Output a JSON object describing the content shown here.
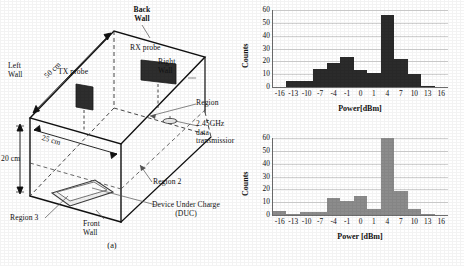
{
  "figure": {
    "panel_a": {
      "caption": "(a)",
      "labels": {
        "back_wall": "Back\nWall",
        "left_wall": "Left\nWall",
        "right_wall": "Right\nWall",
        "front_wall": "Front\nWall",
        "rx_probe": "RX probe",
        "tx_probe": "TX probe",
        "dim_depth": "50 cm",
        "dim_width": "25 cm",
        "dim_height": "20 cm",
        "region_1": "Region",
        "region_2": "Region 2",
        "region_3": "Region 3",
        "transmitter": "2.45GHz\ndata\ntransmissior",
        "duc": "Device Under Charge\n(DUC)"
      },
      "label_lines": {
        "back_wall_1": "Back",
        "back_wall_2": "Wall",
        "left_wall_1": "Left",
        "left_wall_2": "Wall",
        "right_wall_1": "Right",
        "right_wall_2": "Wall",
        "front_wall_1": "Front",
        "front_wall_2": "Wall",
        "transmitter_1": "2.45GHz",
        "transmitter_2": "data",
        "transmitter_3": "transmissior",
        "duc_1": "Device Under Charge",
        "duc_2": "(DUC)"
      }
    },
    "panel_b": {
      "caption": "(b)"
    }
  },
  "chart_data": [
    {
      "type": "bar",
      "title": "",
      "subtitle": "",
      "xlabel": "Power[dBm]",
      "ylabel": "Counts",
      "categories": [
        "-16",
        "-13",
        "-10",
        "-7",
        "-4",
        "-1",
        "0",
        "1",
        "4",
        "7",
        "10",
        "13",
        "16"
      ],
      "x": [
        -16,
        -13,
        -10,
        -7,
        -4,
        -1,
        0,
        1,
        4,
        7,
        10,
        13,
        16
      ],
      "values": [
        0,
        5,
        5,
        14,
        19,
        23,
        13,
        11,
        56,
        22,
        10,
        1,
        0
      ],
      "xlim": [
        -17.5,
        17.5
      ],
      "ylim": [
        0,
        60
      ],
      "yticks": [
        0,
        10,
        20,
        30,
        40,
        50,
        60
      ],
      "grid": true,
      "legend": "none",
      "bar_color": "#2b2b2b",
      "panel": "top"
    },
    {
      "type": "bar",
      "title": "",
      "subtitle": "",
      "xlabel": "Power [dBm]",
      "ylabel": "Counts",
      "categories": [
        "-16",
        "-13",
        "-10",
        "-7",
        "-4",
        "-1",
        "0",
        "1",
        "4",
        "7",
        "10",
        "13",
        "16"
      ],
      "x": [
        -16,
        -13,
        -10,
        -7,
        -4,
        -1,
        0,
        1,
        4,
        7,
        10,
        13,
        16
      ],
      "values": [
        3,
        1,
        2,
        2,
        13,
        11,
        15,
        5,
        60,
        19,
        5,
        1,
        0
      ],
      "xlim": [
        -17.5,
        17.5
      ],
      "ylim": [
        0,
        60
      ],
      "yticks": [
        0,
        10,
        20,
        30,
        40,
        50,
        60
      ],
      "grid": true,
      "legend": "none",
      "bar_color": "#8c8c8c",
      "panel": "bottom"
    }
  ]
}
